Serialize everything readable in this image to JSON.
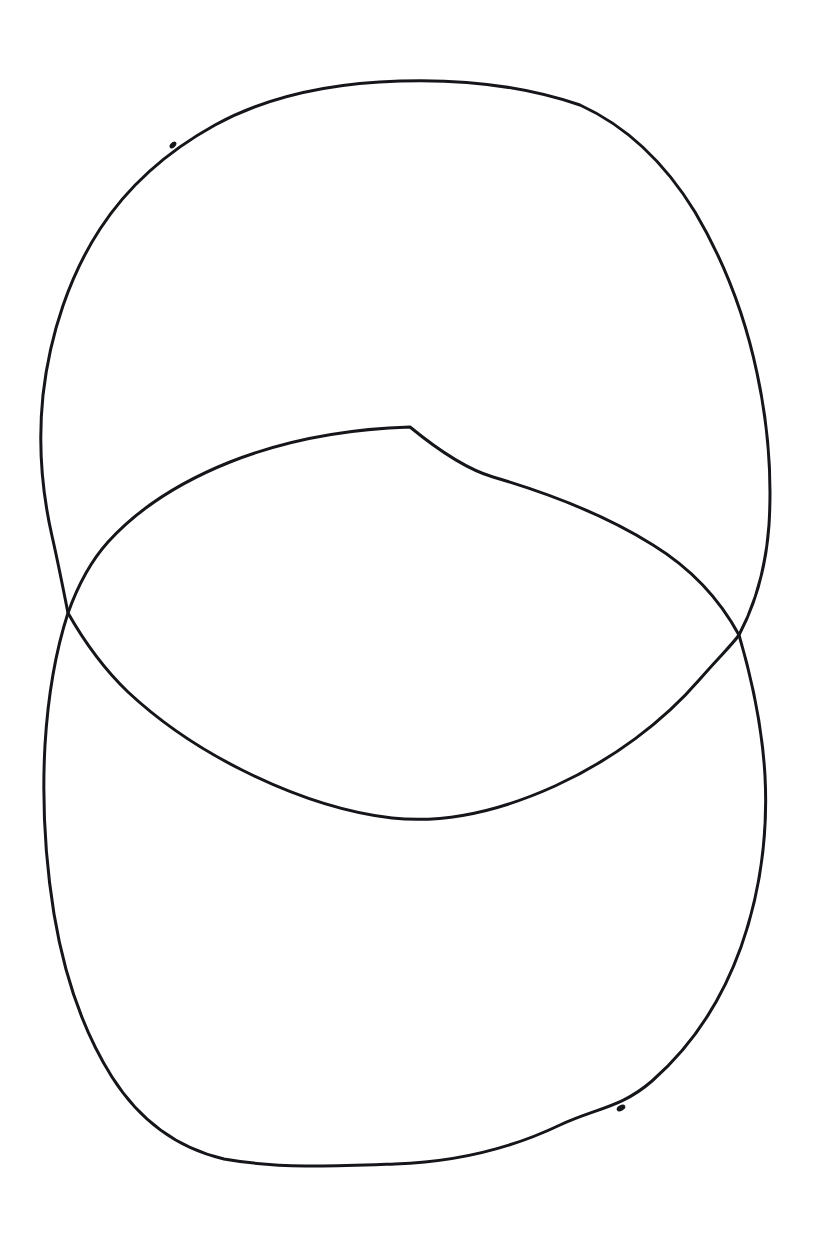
{
  "page": {
    "width": 816,
    "height": 1234,
    "background_color": "#ffffff",
    "ink_color": "#14161a",
    "medium": "pen-on-paper-scan"
  },
  "top_text_strip": {
    "name": "cropped-header-text",
    "visible_text": "•  •    •     •  •     •      •  •",
    "note_visible": "only the bottom 2-3 pixels of a line of text are visible at the very top edge; glyphs are not legible",
    "opacity": "0.30"
  },
  "figure": {
    "name": "two-overlapping-closed-curves",
    "stroke_width_px": 3,
    "shapes": [
      {
        "id": "upper-loop",
        "label": "Upper loop",
        "bounds": {
          "x_min": 42,
          "y_min": 81,
          "x_max": 770,
          "y_max": 822
        },
        "extrema": {
          "top": [
            400,
            81
          ],
          "bottom": [
            392,
            818
          ],
          "left": [
            42,
            420
          ],
          "right": [
            769,
            470
          ]
        },
        "path": "M 400 81 C 330 83 268 96 215 125 C 168 151 128 186 100 229 C 70 275 50 333 43 395 C 38 443 42 492 52 536 C 58 562 63 588 68 613 C 85 643 104 669 128 692 C 158 720 196 747 242 770 C 292 795 340 812 392 818 C 447 824 502 810 555 786 C 612 760 663 722 700 679 C 719 657 731 646 739 635 C 756 603 766 567 769 525 C 772 476 768 424 757 373 C 745 316 724 261 695 212 C 665 163 626 126 580 105 C 524 86 461 79 400 81 Z"
      },
      {
        "id": "lower-loop",
        "label": "Lower loop",
        "bounds": {
          "x_min": 44,
          "y_min": 427,
          "x_max": 766,
          "y_max": 1166
        },
        "extrema": {
          "top": [
            410,
            427
          ],
          "bottom": [
            395,
            1164
          ],
          "left": [
            44,
            832
          ],
          "right": [
            765,
            858
          ]
        },
        "path": "M 410 427 C 345 429 283 441 230 462 C 180 482 138 509 108 542 C 90 562 78 585 68 613 C 56 650 48 695 45 745 C 42 800 45 858 54 914 C 64 974 83 1031 112 1077 C 140 1121 177 1148 224 1159 C 280 1169 341 1166 395 1164 C 455 1162 512 1148 560 1125 C 596 1108 621 1108 652 1081 C 692 1046 722 1000 741 947 C 760 893 768 833 765 776 C 762 722 751 676 739 635 C 720 600 692 569 653 545 C 607 516 551 494 493 477 C 466 469 438 450 410 427 Z"
      }
    ],
    "intersections": [
      {
        "id": "left-crossing",
        "label": "Left crossing point",
        "x": 68,
        "y": 613
      },
      {
        "id": "right-crossing",
        "label": "Right crossing point",
        "x": 739,
        "y": 635
      }
    ],
    "regions": [
      {
        "id": "upper-only",
        "label": "Upper-only region"
      },
      {
        "id": "lens-overlap",
        "label": "Lens overlap region",
        "top_y": 427,
        "bottom_y": 818
      },
      {
        "id": "lower-only",
        "label": "Lower-only region"
      }
    ],
    "nubs": [
      {
        "id": "upper-start-nub",
        "label": "Upper loop pen start mark",
        "x": 173,
        "y": 145,
        "rx": 4.0,
        "ry": 2.6,
        "rotate": -46
      },
      {
        "id": "lower-start-nub",
        "label": "Lower loop pen start mark",
        "x": 621,
        "y": 1108,
        "rx": 4.6,
        "ry": 2.8,
        "rotate": -28
      }
    ]
  }
}
